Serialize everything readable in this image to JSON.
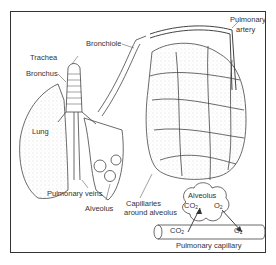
{
  "diagram": {
    "type": "anatomy",
    "labels": {
      "bronchiole": "Bronchiole",
      "pulmonary_artery_line1": "Pulmonary",
      "pulmonary_artery_line2": "artery",
      "trachea": "Trachea",
      "bronchus": "Bronchus",
      "lung": "Lung",
      "pulmonary_veins": "Pulmonary veins",
      "alveolus_left": "Alveolus",
      "capillaries_line1": "Capillaries",
      "capillaries_line2": "around alveolus",
      "alveolus_bottom": "Alveolus",
      "co2_alveolus": "CO",
      "o2_alveolus": "O",
      "co2_capillary": "CO",
      "o2_capillary": "O",
      "sub2": "2",
      "pulmonary_capillary": "Pulmonary capillary"
    },
    "colors": {
      "ink": "#333333",
      "background": "#ffffff",
      "stipple": "#bbbbbb"
    }
  }
}
